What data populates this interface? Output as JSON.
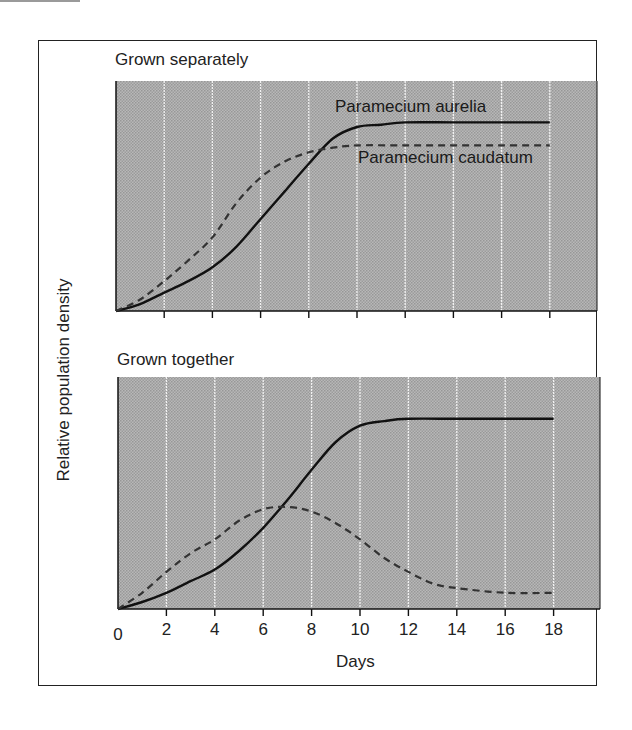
{
  "figure": {
    "ylabel": "Relative population density",
    "xlabel": "Days",
    "background_color": "#a9a9a9",
    "grid_color": "#f2f2f2",
    "line_color": "#111111"
  },
  "chart_data": [
    {
      "type": "line",
      "title": "Grown separately",
      "xlabel": "Days",
      "ylabel": "Relative population density",
      "xlim": [
        0,
        20
      ],
      "ylim": [
        0,
        100
      ],
      "x_ticks": [
        2,
        4,
        6,
        8,
        10,
        12,
        14,
        16,
        18
      ],
      "x_tick_labels_shown": false,
      "grid": "vertical",
      "series": [
        {
          "name": "Paramecium aurelia",
          "style": "solid",
          "x": [
            0,
            1,
            2,
            3,
            4,
            5,
            6,
            7,
            8,
            9,
            10,
            11,
            12,
            14,
            16,
            18
          ],
          "values": [
            0,
            3,
            8,
            13,
            19,
            28,
            40,
            52,
            64,
            75,
            80,
            81,
            82,
            82,
            82,
            82
          ]
        },
        {
          "name": "Paramecium caudatum",
          "style": "dashed",
          "x": [
            0,
            1,
            2,
            3,
            4,
            5,
            6,
            7,
            8,
            9,
            10,
            12,
            14,
            16,
            18
          ],
          "values": [
            0,
            5,
            13,
            22,
            32,
            47,
            58,
            65,
            69,
            71,
            72,
            72,
            72,
            72,
            72
          ]
        }
      ],
      "annotations": [
        {
          "text": "Paramecium aurelia",
          "near_series": "Paramecium aurelia"
        },
        {
          "text": "Paramecium caudatum",
          "near_series": "Paramecium caudatum"
        }
      ]
    },
    {
      "type": "line",
      "title": "Grown together",
      "xlabel": "Days",
      "ylabel": "Relative population density",
      "xlim": [
        0,
        20
      ],
      "ylim": [
        0,
        100
      ],
      "x_ticks": [
        0,
        2,
        4,
        6,
        8,
        10,
        12,
        14,
        16,
        18
      ],
      "x_tick_labels": [
        "0",
        "2",
        "4",
        "6",
        "8",
        "10",
        "12",
        "14",
        "16",
        "18"
      ],
      "grid": "vertical",
      "series": [
        {
          "name": "Paramecium aurelia",
          "style": "solid",
          "x": [
            0,
            1,
            2,
            3,
            4,
            5,
            6,
            7,
            8,
            9,
            10,
            11,
            12,
            14,
            16,
            18
          ],
          "values": [
            0,
            3,
            7,
            12,
            17,
            25,
            35,
            47,
            60,
            72,
            79,
            81,
            82,
            82,
            82,
            82
          ]
        },
        {
          "name": "Paramecium caudatum",
          "style": "dashed",
          "x": [
            0,
            1,
            2,
            3,
            4,
            5,
            6,
            7,
            8,
            9,
            10,
            11,
            12,
            13,
            14,
            16,
            18
          ],
          "values": [
            0,
            7,
            16,
            24,
            30,
            38,
            43,
            44,
            42,
            37,
            30,
            22,
            16,
            11,
            9,
            7,
            7
          ]
        }
      ]
    }
  ],
  "panels": [
    {
      "title": "Grown separately"
    },
    {
      "title": "Grown together"
    }
  ],
  "labels": {
    "aurelia": "Paramecium aurelia",
    "caudatum": "Paramecium caudatum"
  }
}
